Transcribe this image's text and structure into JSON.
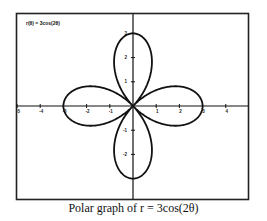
{
  "chart_data": {
    "type": "line",
    "subtype": "polar",
    "title": "Polar graph of r = 3cos(2θ)",
    "legend_label": "r(θ) = 3cos(2θ)",
    "equation": {
      "a": 3,
      "k": 2
    },
    "xlabel": "",
    "ylabel": "",
    "xlim": [
      -5,
      5
    ],
    "ylim": [
      -4,
      4
    ],
    "x_ticks": [
      -5,
      -4,
      -3,
      -2,
      -1,
      1,
      2,
      3,
      4
    ],
    "x_tick_labels": [
      "-5",
      "-4",
      "-3",
      "-2",
      "-1",
      "1",
      "2",
      "3",
      "4"
    ],
    "y_ticks": [
      3,
      2,
      1,
      -1,
      -2
    ],
    "y_tick_labels": [
      "3",
      "2",
      "1",
      "-1",
      "-2"
    ],
    "grid": false,
    "series": [
      {
        "name": "r(θ) = 3cos(2θ)",
        "description": "Four-petal rose; petals reach radius 3 along +x, -x, +y, -y axes",
        "petal_tips": [
          [
            3,
            0
          ],
          [
            0,
            3
          ],
          [
            -3,
            0
          ],
          [
            0,
            -3
          ]
        ],
        "color": "#111111"
      }
    ]
  },
  "caption": "Polar graph of r = 3cos(2θ)",
  "colors": {
    "frame": "#222222",
    "curve": "#111111",
    "axes": "#111111",
    "background": "#ffffff"
  }
}
